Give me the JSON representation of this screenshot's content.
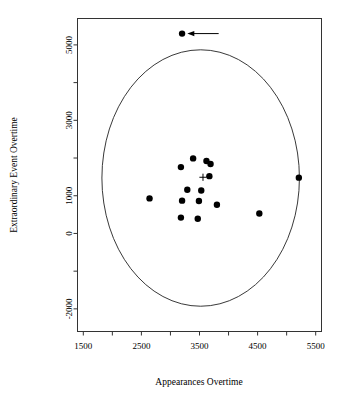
{
  "chart_data": {
    "type": "scatter",
    "title": "",
    "xlabel": "Appearances Overtime",
    "ylabel": "Extraordinary Event Overtime",
    "xlim": [
      1400,
      5600
    ],
    "ylim": [
      -2600,
      5700
    ],
    "xticks": [
      1500,
      2000,
      2500,
      3000,
      3500,
      4000,
      4500,
      5000,
      5500
    ],
    "xtick_labels": [
      "1500",
      "",
      "2500",
      "",
      "3500",
      "",
      "4500",
      "",
      "5500"
    ],
    "yticks": [
      -2000,
      -1000,
      0,
      1000,
      2000,
      3000,
      4000,
      5000
    ],
    "ytick_labels": [
      "-2000",
      "",
      "0",
      "1000",
      "",
      "3000",
      "",
      "5000"
    ],
    "grid": false,
    "legend": null,
    "points": [
      {
        "x": 3200,
        "y": 5300,
        "label": "outlier"
      },
      {
        "x": 3390,
        "y": 1990,
        "label": ""
      },
      {
        "x": 3620,
        "y": 1920,
        "label": ""
      },
      {
        "x": 3690,
        "y": 1840,
        "label": ""
      },
      {
        "x": 3180,
        "y": 1760,
        "label": ""
      },
      {
        "x": 3670,
        "y": 1520,
        "label": ""
      },
      {
        "x": 5210,
        "y": 1480,
        "label": ""
      },
      {
        "x": 3290,
        "y": 1160,
        "label": ""
      },
      {
        "x": 3530,
        "y": 1140,
        "label": ""
      },
      {
        "x": 2640,
        "y": 930,
        "label": ""
      },
      {
        "x": 3200,
        "y": 870,
        "label": ""
      },
      {
        "x": 3490,
        "y": 860,
        "label": ""
      },
      {
        "x": 3800,
        "y": 760,
        "label": ""
      },
      {
        "x": 4530,
        "y": 530,
        "label": ""
      },
      {
        "x": 3180,
        "y": 420,
        "label": ""
      },
      {
        "x": 3470,
        "y": 390,
        "label": ""
      }
    ],
    "centroid": {
      "x": 3560,
      "y": 1490,
      "marker": "plus"
    },
    "ellipse": {
      "cx": 3520,
      "cy": 1470,
      "rx": 1700,
      "ry": 3400,
      "rotation_deg": 0,
      "stroke": "#222222"
    },
    "annotation": {
      "type": "arrow",
      "text": "",
      "from_x": 3830,
      "from_y": 5300,
      "to_x": 3290,
      "to_y": 5300
    }
  },
  "colors": {
    "point": "#000000",
    "frame": "#333333",
    "ellipse": "#222222",
    "background": "#ffffff"
  }
}
